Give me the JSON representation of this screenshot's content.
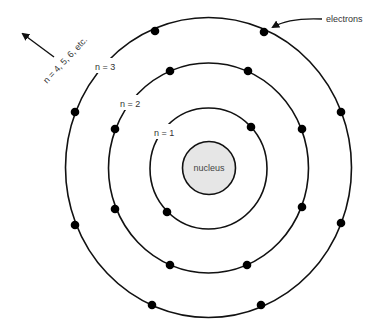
{
  "diagram": {
    "type": "bohr-atom-model",
    "nucleus": {
      "label": "nucleus",
      "fill": "#e6e6e6",
      "stroke": "#111111"
    },
    "shells": [
      {
        "n": 1,
        "label": "n = 1",
        "electrons": 2
      },
      {
        "n": 2,
        "label": "n = 2",
        "electrons": 8
      },
      {
        "n": 3,
        "label": "n = 3",
        "electrons": 8
      }
    ],
    "annotations": {
      "outer_shells": "n = 4, 5, 6, etc.",
      "electrons": "electrons"
    },
    "colors": {
      "line": "#111111",
      "electron": "#000000",
      "text": "#333333",
      "background": "#ffffff"
    }
  }
}
